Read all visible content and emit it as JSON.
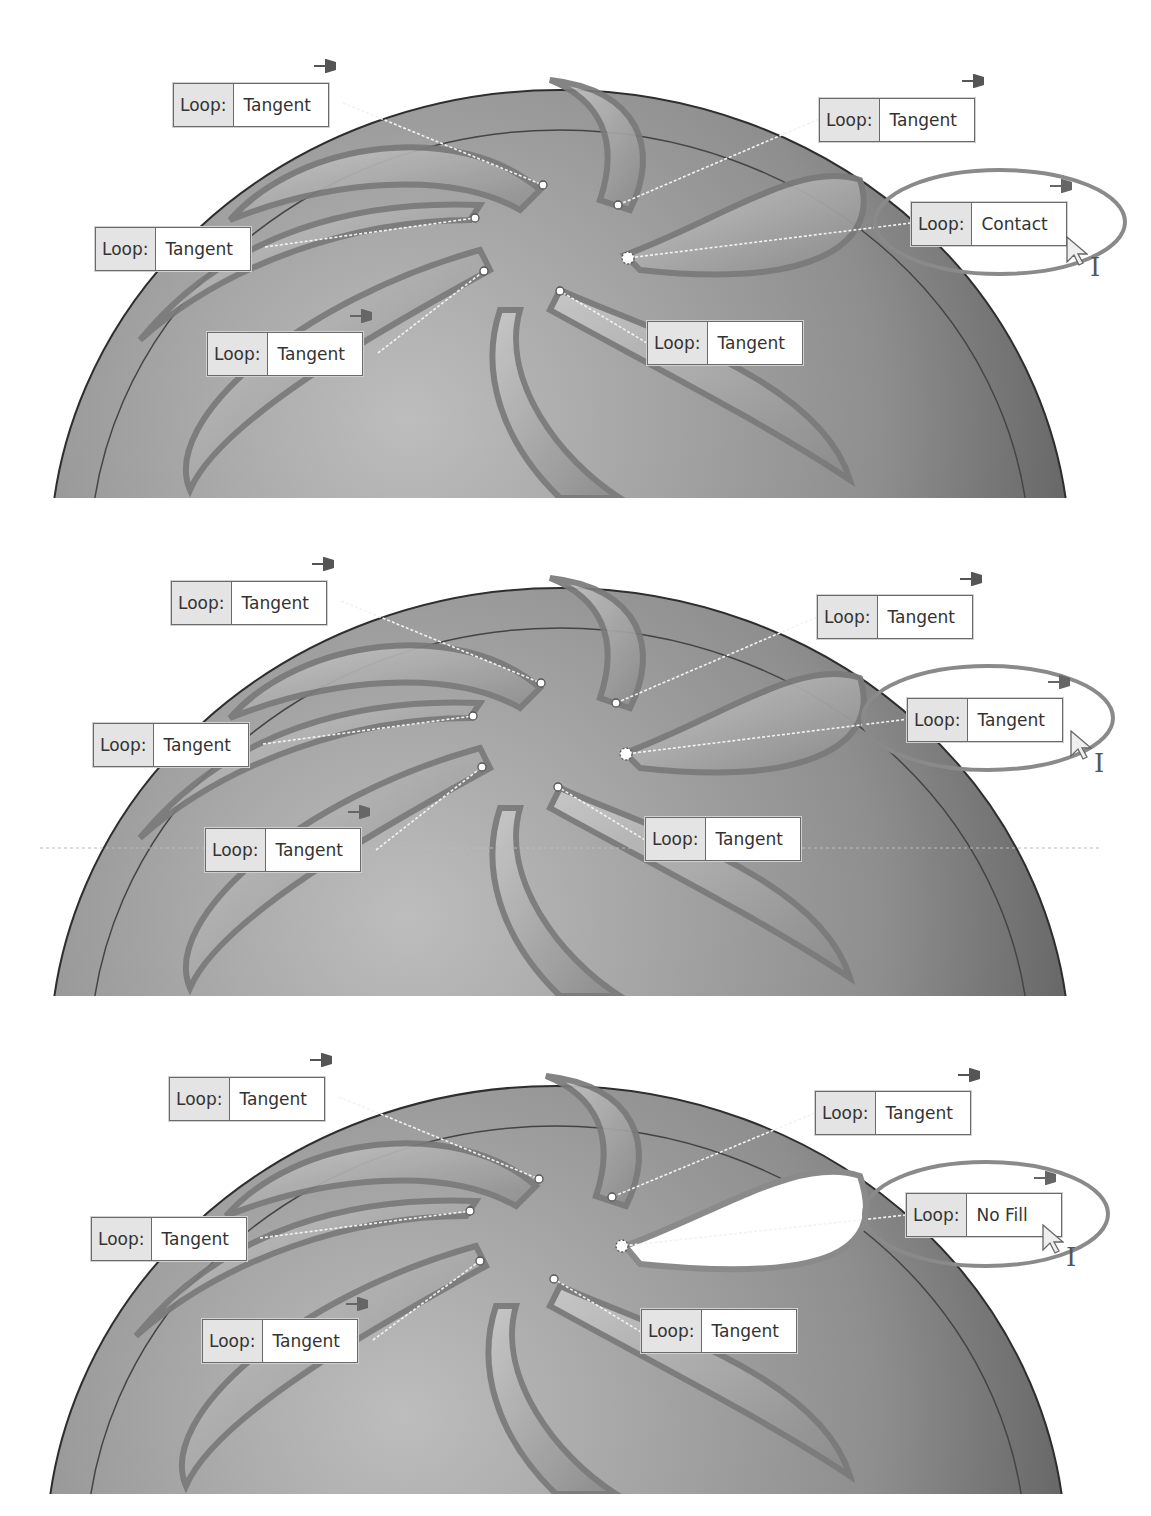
{
  "figure": {
    "colors": {
      "part_dark": "#5a5a5a",
      "part_light": "#b8b8b8",
      "highlight_ring": "#8a8a8a",
      "callout_key_bg": "#e4e4e4",
      "callout_border": "#6a6a6a"
    }
  },
  "panels": [
    {
      "name": "panel-1",
      "callouts": [
        {
          "key": "Loop:",
          "value": "Tangent"
        },
        {
          "key": "Loop:",
          "value": "Tangent"
        },
        {
          "key": "Loop:",
          "value": "Contact"
        },
        {
          "key": "Loop:",
          "value": "Tangent"
        },
        {
          "key": "Loop:",
          "value": "Tangent"
        },
        {
          "key": "Loop:",
          "value": "Tangent"
        }
      ],
      "highlighted_index": 2
    },
    {
      "name": "panel-2",
      "callouts": [
        {
          "key": "Loop:",
          "value": "Tangent"
        },
        {
          "key": "Loop:",
          "value": "Tangent"
        },
        {
          "key": "Loop:",
          "value": "Tangent"
        },
        {
          "key": "Loop:",
          "value": "Tangent"
        },
        {
          "key": "Loop:",
          "value": "Tangent"
        },
        {
          "key": "Loop:",
          "value": "Tangent"
        }
      ],
      "highlighted_index": 2
    },
    {
      "name": "panel-3",
      "callouts": [
        {
          "key": "Loop:",
          "value": "Tangent"
        },
        {
          "key": "Loop:",
          "value": "Tangent"
        },
        {
          "key": "Loop:",
          "value": "No Fill"
        },
        {
          "key": "Loop:",
          "value": "Tangent"
        },
        {
          "key": "Loop:",
          "value": "Tangent"
        },
        {
          "key": "Loop:",
          "value": "Tangent"
        }
      ],
      "highlighted_index": 2
    }
  ]
}
